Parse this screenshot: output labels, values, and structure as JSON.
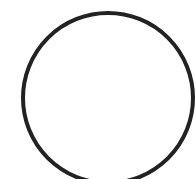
{
  "canvas": {
    "width": 196,
    "height": 179,
    "background": "#ffffff"
  },
  "shape": {
    "type": "circle",
    "cx": 108,
    "cy": 98,
    "r": 85,
    "stroke": "#222222",
    "stroke_width": 4,
    "fill": "none"
  }
}
